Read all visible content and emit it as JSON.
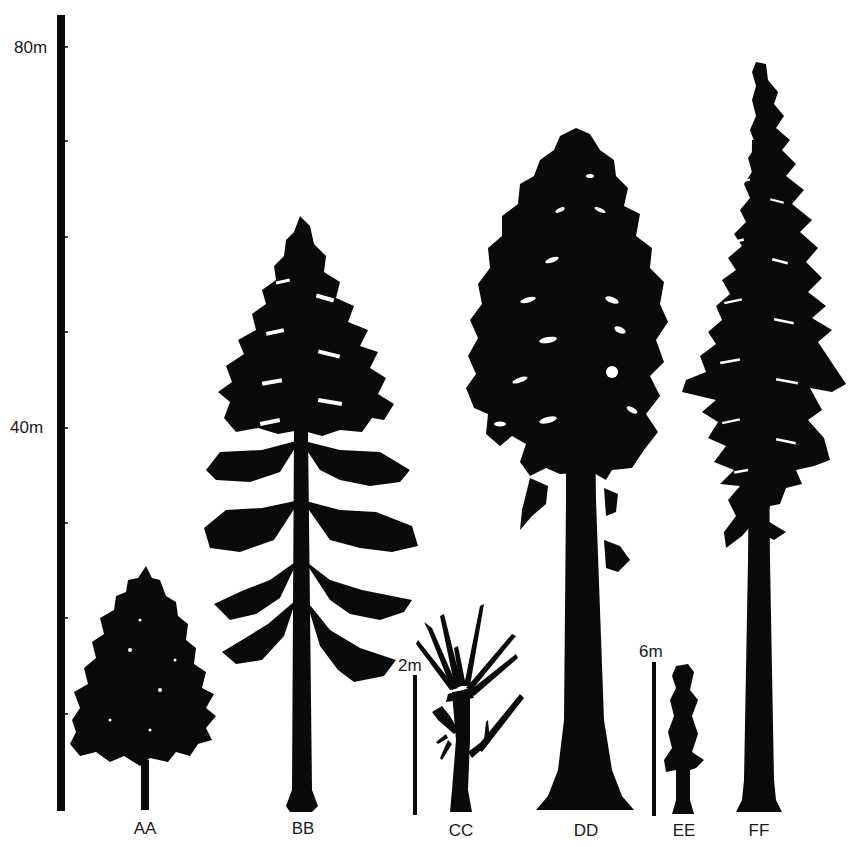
{
  "figure": {
    "main_scale": {
      "labels": [
        {
          "text": "80m",
          "value_m": 80
        },
        {
          "text": "40m",
          "value_m": 40
        }
      ],
      "tick_interval_m": 10,
      "range_m": [
        0,
        80
      ]
    },
    "inset_scales": [
      {
        "text": "2m",
        "applies_to": "CC"
      },
      {
        "text": "6m",
        "applies_to": "EE"
      }
    ],
    "trees": [
      {
        "id": "AA",
        "label": "AA",
        "height_m_main_scale": 25,
        "shape": "broad conifer"
      },
      {
        "id": "BB",
        "label": "BB",
        "height_m_main_scale": 62,
        "shape": "spreading conifer"
      },
      {
        "id": "CC",
        "label": "CC",
        "height_m_inset": 2.6,
        "shape": "fern-like stem with fronds"
      },
      {
        "id": "DD",
        "label": "DD",
        "height_m_main_scale": 72,
        "shape": "massive sequoia-like"
      },
      {
        "id": "EE",
        "label": "EE",
        "height_m_inset": 6.5,
        "shape": "narrow columnar"
      },
      {
        "id": "FF",
        "label": "FF",
        "height_m_main_scale": 78,
        "shape": "tall narrow conifer"
      }
    ]
  }
}
